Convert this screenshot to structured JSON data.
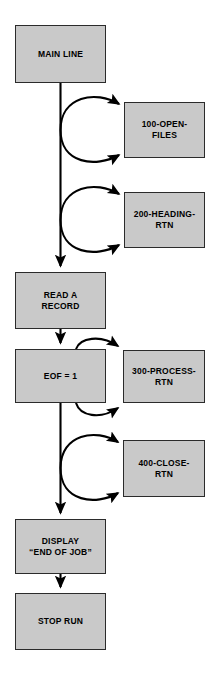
{
  "diagram": {
    "type": "flowchart",
    "background_color": "#ffffff",
    "node_fill_color": "#c9c9c9",
    "node_border_color": "#2b2b2b",
    "connector_color": "#000000",
    "nodes": [
      {
        "id": "main-line",
        "label": "MAIN LINE",
        "column": "left",
        "x": 15,
        "y": 25,
        "w": 91,
        "h": 58
      },
      {
        "id": "open-files",
        "label": "100-OPEN-\nFILES",
        "column": "right",
        "x": 124,
        "y": 102,
        "w": 81,
        "h": 56
      },
      {
        "id": "heading-rtn",
        "label": "200-HEADING-\nRTN",
        "column": "right",
        "x": 124,
        "y": 192,
        "w": 81,
        "h": 56
      },
      {
        "id": "read-a-record",
        "label": "READ A\nRECORD",
        "column": "left",
        "x": 15,
        "y": 272,
        "w": 91,
        "h": 57
      },
      {
        "id": "eof-test",
        "label": "EOF = 1",
        "column": "left",
        "x": 15,
        "y": 349,
        "w": 91,
        "h": 54
      },
      {
        "id": "process-rtn",
        "label": "300-PROCESS-\nRTN",
        "column": "right",
        "x": 123,
        "y": 350,
        "w": 82,
        "h": 53
      },
      {
        "id": "close-rtn",
        "label": "400-CLOSE-\nRTN",
        "column": "right",
        "x": 123,
        "y": 440,
        "w": 82,
        "h": 57
      },
      {
        "id": "display-end-of-job",
        "label": "DISPLAY\n“END OF JOB”",
        "column": "left",
        "x": 15,
        "y": 519,
        "w": 91,
        "h": 55
      },
      {
        "id": "stop-run",
        "label": "STOP RUN",
        "column": "left",
        "x": 15,
        "y": 593,
        "w": 91,
        "h": 57
      }
    ],
    "connectors": [
      {
        "id": "main-spine",
        "from": "main-line",
        "to": "stop-run",
        "kind": "vertical-line"
      },
      {
        "id": "call-open-files",
        "from": "main-line",
        "to": "open-files",
        "kind": "call-return-loop"
      },
      {
        "id": "call-heading-rtn",
        "from": "main-line",
        "to": "heading-rtn",
        "kind": "call-return-loop"
      },
      {
        "id": "call-process-rtn",
        "from": "eof-test",
        "to": "process-rtn",
        "kind": "call-return-loop"
      },
      {
        "id": "call-close-rtn",
        "from": "eof-test",
        "to": "close-rtn",
        "kind": "call-return-loop"
      }
    ]
  }
}
